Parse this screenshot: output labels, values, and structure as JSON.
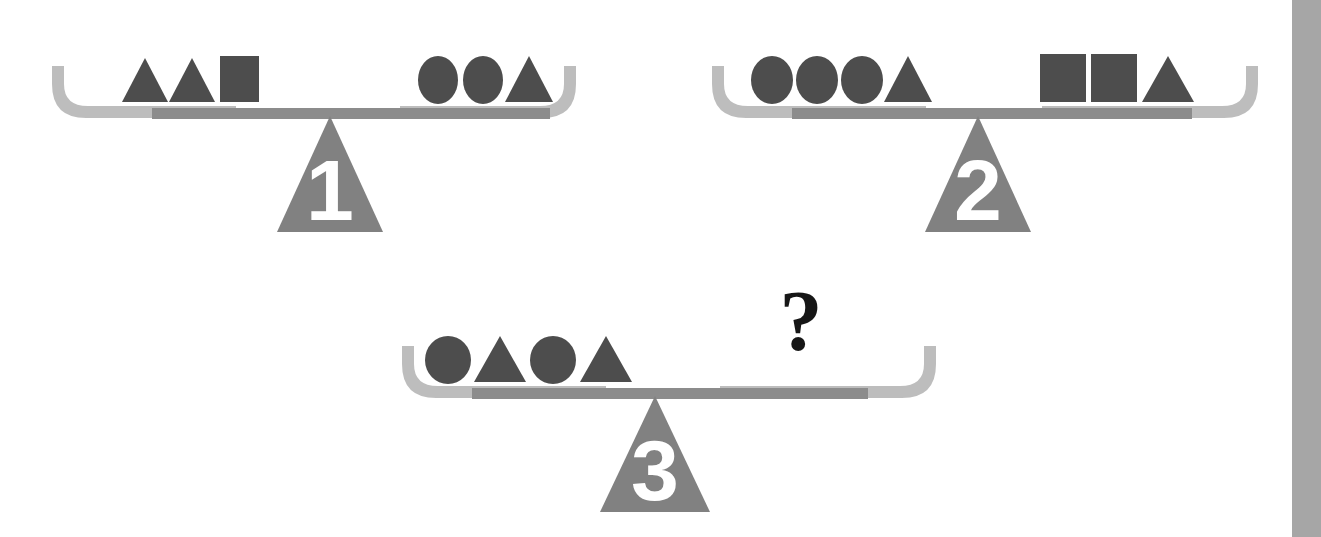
{
  "page": {
    "background_color": "#ffffff",
    "width": 1321,
    "height": 537
  },
  "colors": {
    "shape_fill": "#4d4d4d",
    "beam_fill": "#8c8c8c",
    "pan_fill": "#bdbdbd",
    "fulcrum_fill": "#818181",
    "digit_fill": "#ffffff",
    "question_fill": "#161616",
    "gutter_fill": "#a6a6a6"
  },
  "right_gutter": {
    "name": "page-edge-band",
    "color": "#a6a6a6"
  },
  "scales": [
    {
      "id": "scale-1",
      "label": "1",
      "state": "balanced",
      "left_pan": {
        "name": "scale-1-left-pan",
        "shapes": [
          "triangle",
          "triangle",
          "square"
        ]
      },
      "right_pan": {
        "name": "scale-1-right-pan",
        "shapes": [
          "circle",
          "circle",
          "triangle"
        ]
      },
      "has_question": false
    },
    {
      "id": "scale-2",
      "label": "2",
      "state": "balanced",
      "left_pan": {
        "name": "scale-2-left-pan",
        "shapes": [
          "circle",
          "circle",
          "circle",
          "triangle"
        ]
      },
      "right_pan": {
        "name": "scale-2-right-pan",
        "shapes": [
          "square",
          "square",
          "triangle"
        ]
      },
      "has_question": false
    },
    {
      "id": "scale-3",
      "label": "3",
      "state": "balanced",
      "left_pan": {
        "name": "scale-3-left-pan",
        "shapes": [
          "circle",
          "triangle",
          "circle",
          "triangle"
        ]
      },
      "right_pan": {
        "name": "scale-3-right-pan",
        "shapes": []
      },
      "has_question": true,
      "question_mark": "?"
    }
  ],
  "labels": {
    "scale_1_number": "1",
    "scale_2_number": "2",
    "scale_3_number": "3",
    "unknown_marker": "?"
  }
}
